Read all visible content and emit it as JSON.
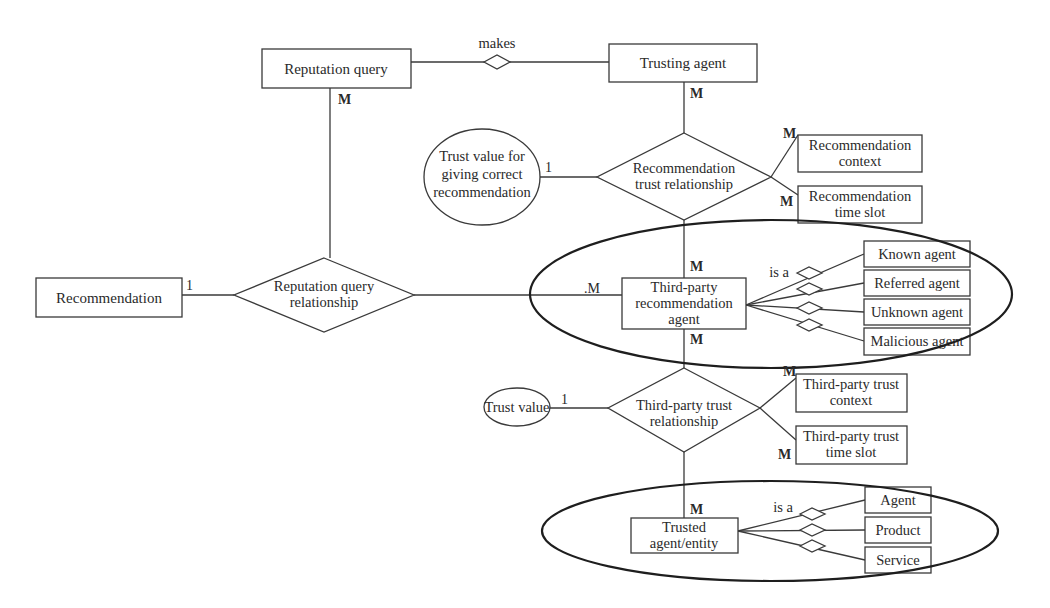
{
  "diagram": {
    "type": "ER diagram",
    "entities": {
      "reputation_query": "Reputation query",
      "trusting_agent": "Trusting agent",
      "recommendation": "Recommendation",
      "rec_context": [
        "Recommendation",
        "context"
      ],
      "rec_time_slot": [
        "Recommendation",
        "time slot"
      ],
      "third_party_agent": [
        "Third-party",
        "recommendation",
        "agent"
      ],
      "known_agent": "Known agent",
      "referred_agent": "Referred agent",
      "unknown_agent": "Unknown agent",
      "malicious_agent": "Malicious agent",
      "tp_trust_context": [
        "Third-party trust",
        "context"
      ],
      "tp_trust_time_slot": [
        "Third-party trust",
        "time slot"
      ],
      "trusted_entity": [
        "Trusted",
        "agent/entity"
      ],
      "agent": "Agent",
      "product": "Product",
      "service": "Service"
    },
    "relationships": {
      "makes": "makes",
      "rec_trust": [
        "Recommendation",
        "trust relationship"
      ],
      "rep_query_rel": [
        "Reputation query",
        "relationship"
      ],
      "tp_trust": [
        "Third-party trust",
        "relationship"
      ],
      "is_a_1": "is a",
      "is_a_2": "is a"
    },
    "attributes": {
      "trust_value_rec": [
        "Trust value for",
        "giving correct",
        "recommendation"
      ],
      "trust_value": "Trust value"
    },
    "cardinalities": {
      "rq_trusting_M": "M",
      "trusting_M": "M",
      "rec_one": "1",
      "trust_val_rec_one": "1",
      "rec_context_M": "M",
      "rec_time_M": "M",
      "tp_top_M": "M",
      "tp_left_M": ".M",
      "tp_bottom_M": "M",
      "trust_val_one": "1",
      "tp_context_M": "M",
      "tp_time_M": "M",
      "trusted_M": "M"
    }
  }
}
